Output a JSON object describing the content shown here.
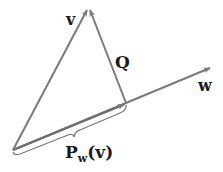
{
  "diagram": {
    "colors": {
      "vector": "#7a7a7a",
      "label": "#1a1a1a",
      "background": "#ffffff"
    },
    "points": {
      "origin": [
        13,
        150
      ],
      "v_tip": [
        88,
        8
      ],
      "proj_tip": [
        126,
        104
      ],
      "w_tip": [
        212,
        67
      ]
    },
    "labels": {
      "v": "v",
      "q": "Q",
      "w": "w",
      "proj_main": "P",
      "proj_sub": "w",
      "proj_arg": "(v)"
    }
  }
}
